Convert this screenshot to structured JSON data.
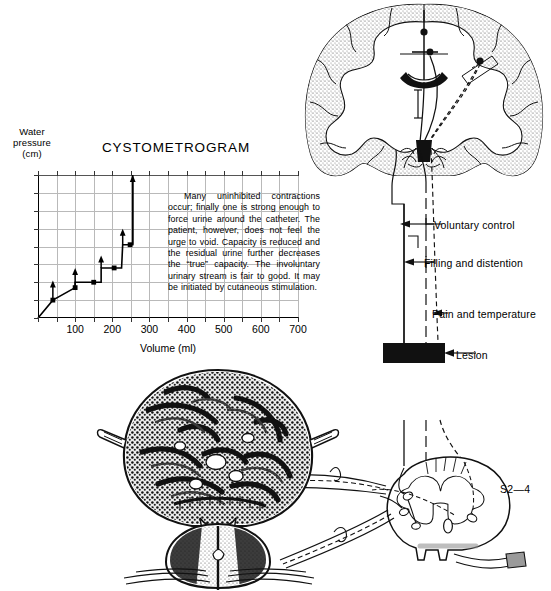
{
  "figure": {
    "s_level_label": "S2—4"
  },
  "chart_labels": {
    "y_axis_title_line1": "Water",
    "y_axis_title_line2": "pressure",
    "y_axis_title_line3": "(cm)",
    "x_axis_title": "Volume (ml)",
    "chart_title": "CYSTOMETROGRAM"
  },
  "caption": {
    "text": "Many uninhibited contractions occur; finally one is strong enough to force urine around the catheter. The patient, however, does not feel the urge to void. Capacity is reduced and the residual urine further decreases the “true” capacity. The involuntary urinary stream is fair to good. It may be initiated by cutaneous stimulation."
  },
  "pathway_labels": {
    "voluntary": "Voluntary control",
    "filling": "Filling and distention",
    "pain": "Pain and temperature",
    "lesion": "Lesion",
    "segment": "S2—4"
  },
  "chart_data": {
    "type": "line",
    "title": "CYSTOMETROGRAM",
    "xlabel": "Volume (ml)",
    "ylabel": "Water pressure (cm)",
    "xlim": [
      0,
      700
    ],
    "ylim": [
      0,
      80
    ],
    "xticks": [
      0,
      100,
      200,
      300,
      400,
      500,
      600,
      700
    ],
    "yticks": [
      0,
      10,
      20,
      30,
      40,
      50,
      60,
      70,
      80
    ],
    "xtick_labels": [
      "0",
      "100",
      "200",
      "300",
      "400",
      "500",
      "600",
      "700"
    ],
    "ytick_labels": [
      "0",
      "10",
      "20",
      "30",
      "40",
      "50",
      "60",
      "70",
      "80"
    ],
    "x_minor_tick_interval": 50,
    "grid": true,
    "grid_x_interval": 50,
    "grid_y_interval": 10,
    "legend": null,
    "series": [
      {
        "name": "Bladder filling pressure trace",
        "points": [
          {
            "x": 0,
            "y": 0
          },
          {
            "x": 40,
            "y": 10
          },
          {
            "x": 100,
            "y": 17
          },
          {
            "x": 100,
            "y": 20
          },
          {
            "x": 150,
            "y": 20
          },
          {
            "x": 170,
            "y": 20
          },
          {
            "x": 170,
            "y": 28
          },
          {
            "x": 225,
            "y": 28
          },
          {
            "x": 228,
            "y": 41
          },
          {
            "x": 255,
            "y": 41
          },
          {
            "x": 255,
            "y": 80
          }
        ]
      }
    ],
    "markers": [
      {
        "x": 40,
        "y": 10
      },
      {
        "x": 100,
        "y": 17
      },
      {
        "x": 150,
        "y": 20
      },
      {
        "x": 205,
        "y": 28
      },
      {
        "x": 248,
        "y": 41
      }
    ],
    "contraction_arrows": [
      {
        "x": 40,
        "y_from": 10,
        "y_to": 21
      },
      {
        "x": 100,
        "y_from": 17,
        "y_to": 28
      },
      {
        "x": 170,
        "y_from": 28,
        "y_to": 35
      },
      {
        "x": 228,
        "y_from": 41,
        "y_to": 50
      },
      {
        "x": 255,
        "y_from": 41,
        "y_to": 80
      }
    ],
    "annotation": "Many uninhibited contractions occur; finally one is strong enough to force urine around the catheter."
  }
}
